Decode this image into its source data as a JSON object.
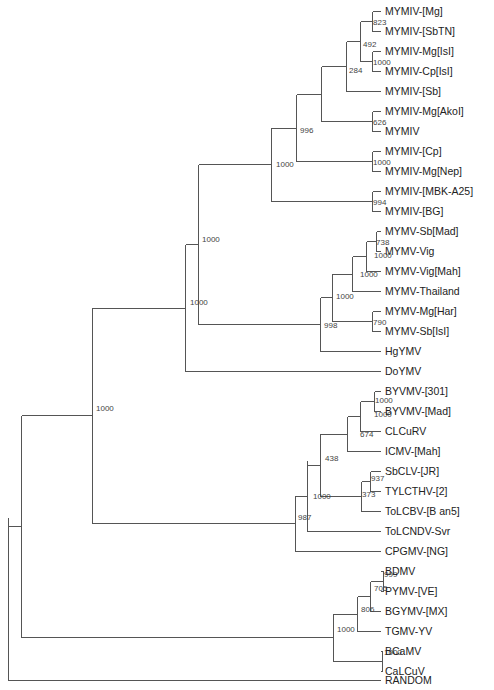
{
  "diagram": {
    "type": "phylogenetic-tree",
    "colors": {
      "branch": "#555555",
      "label": "#222222",
      "bootstrap": "#444444",
      "background": "#ffffff"
    },
    "leaf_x": 380,
    "leaves": [
      {
        "id": "L0",
        "label": "MYMIV-[Mg]",
        "y": 11
      },
      {
        "id": "L1",
        "label": "MYMIV-[SbTN]",
        "y": 31
      },
      {
        "id": "L2",
        "label": "MYMIV-Mg[IsI]",
        "y": 51
      },
      {
        "id": "L3",
        "label": "MYMIV-Cp[IsI]",
        "y": 71
      },
      {
        "id": "L4",
        "label": "MYMIV-[Sb]",
        "y": 91
      },
      {
        "id": "L5",
        "label": "MYMIV-Mg[AkoI]",
        "y": 111
      },
      {
        "id": "L6",
        "label": "MYMIV",
        "y": 131
      },
      {
        "id": "L7",
        "label": "MYMIV-[Cp]",
        "y": 151
      },
      {
        "id": "L8",
        "label": "MYMIV-Mg[Nep]",
        "y": 171
      },
      {
        "id": "L9",
        "label": "MYMIV-[MBK-A25]",
        "y": 191
      },
      {
        "id": "L10",
        "label": "MYMIV-[BG]",
        "y": 211
      },
      {
        "id": "L11",
        "label": "MYMV-Sb[Mad]",
        "y": 231
      },
      {
        "id": "L12",
        "label": "MYMV-Vig",
        "y": 251
      },
      {
        "id": "L13",
        "label": "MYMV-Vig[Mah]",
        "y": 271
      },
      {
        "id": "L14",
        "label": "MYMV-Thailand",
        "y": 291
      },
      {
        "id": "L15",
        "label": "MYMV-Mg[Har]",
        "y": 311
      },
      {
        "id": "L16",
        "label": "MYMV-Sb[IsI]",
        "y": 331
      },
      {
        "id": "L17",
        "label": "HgYMV",
        "y": 351
      },
      {
        "id": "L18",
        "label": "DoYMV",
        "y": 371
      },
      {
        "id": "L19",
        "label": "BYVMV-[301]",
        "y": 391
      },
      {
        "id": "L20",
        "label": "BYVMV-[Mad]",
        "y": 411
      },
      {
        "id": "L21",
        "label": "CLCuRV",
        "y": 431
      },
      {
        "id": "L22",
        "label": "ICMV-[Mah]",
        "y": 451
      },
      {
        "id": "L23",
        "label": "SbCLV-[JR]",
        "y": 471
      },
      {
        "id": "L24",
        "label": "TYLCTHV-[2]",
        "y": 491
      },
      {
        "id": "L25",
        "label": "ToLCBV-[B an5]",
        "y": 511
      },
      {
        "id": "L26",
        "label": "ToLCNDV-Svr",
        "y": 531
      },
      {
        "id": "L27",
        "label": "CPGMV-[NG]",
        "y": 551
      },
      {
        "id": "L28",
        "label": "BDMV",
        "y": 571
      },
      {
        "id": "L29",
        "label": "PYMV-[VE]",
        "y": 591
      },
      {
        "id": "L30",
        "label": "BGYMV-[MX]",
        "y": 611
      },
      {
        "id": "L31",
        "label": "TGMV-YV",
        "y": 631
      },
      {
        "id": "L32",
        "label": "BCaMV",
        "y": 651
      },
      {
        "id": "L33",
        "label": "CaLCuV",
        "y": 671
      },
      {
        "id": "L34",
        "label": "RANDOM",
        "y": 680
      }
    ],
    "nodes": [
      {
        "id": "n_mg_sbtn",
        "x": 372,
        "y1": 11,
        "y2": 31,
        "parent_x": 360,
        "bootstrap": "823",
        "bx": 373,
        "by": 25
      },
      {
        "id": "n_isi",
        "x": 372,
        "y1": 51,
        "y2": 71,
        "parent_x": 360,
        "bootstrap": "1000",
        "bx": 373,
        "by": 65
      },
      {
        "id": "n_492",
        "x": 360,
        "y1": 21,
        "y2": 61,
        "parent_x": 346,
        "bootstrap": "492",
        "bx": 363,
        "by": 47
      },
      {
        "id": "n_284",
        "x": 346,
        "y1": 41,
        "y2": 91,
        "parent_x": 321,
        "bootstrap": "284",
        "bx": 349,
        "by": 73
      },
      {
        "id": "n_akol",
        "x": 372,
        "y1": 111,
        "y2": 131,
        "parent_x": 321,
        "bootstrap": "626",
        "bx": 373,
        "by": 125
      },
      {
        "id": "n_998a",
        "x": 321,
        "y1": 66,
        "y2": 121,
        "parent_x": 296,
        "bootstrap": "",
        "bx": 0,
        "by": 0
      },
      {
        "id": "n_cp",
        "x": 372,
        "y1": 151,
        "y2": 171,
        "parent_x": 296,
        "bootstrap": "1000",
        "bx": 373,
        "by": 165
      },
      {
        "id": "n_996",
        "x": 296,
        "y1": 94,
        "y2": 161,
        "parent_x": 271,
        "bootstrap": "996",
        "bx": 300,
        "by": 133
      },
      {
        "id": "n_bg",
        "x": 372,
        "y1": 191,
        "y2": 211,
        "parent_x": 271,
        "bootstrap": "994",
        "bx": 373,
        "by": 205
      },
      {
        "id": "n_1000a",
        "x": 271,
        "y1": 127,
        "y2": 201,
        "parent_x": 198,
        "bootstrap": "1000",
        "bx": 276,
        "by": 167
      },
      {
        "id": "n_738",
        "x": 376,
        "y1": 231,
        "y2": 251,
        "parent_x": 366,
        "bootstrap": "738",
        "bx": 376,
        "by": 245
      },
      {
        "id": "n_vigmah",
        "x": 366,
        "y1": 241,
        "y2": 271,
        "parent_x": 352,
        "bootstrap": "1000",
        "bx": 374,
        "by": 258
      },
      {
        "id": "n_thai",
        "x": 352,
        "y1": 256,
        "y2": 291,
        "parent_x": 332,
        "bootstrap": "1000",
        "bx": 360,
        "by": 277
      },
      {
        "id": "n_har",
        "x": 372,
        "y1": 311,
        "y2": 331,
        "parent_x": 332,
        "bootstrap": "790",
        "bx": 373,
        "by": 325
      },
      {
        "id": "n_mymv",
        "x": 332,
        "y1": 273,
        "y2": 321,
        "parent_x": 320,
        "bootstrap": "1000",
        "bx": 336,
        "by": 299
      },
      {
        "id": "n_998",
        "x": 320,
        "y1": 297,
        "y2": 351,
        "parent_x": 198,
        "bootstrap": "998",
        "bx": 324,
        "by": 328
      },
      {
        "id": "n_1000b",
        "x": 198,
        "y1": 164,
        "y2": 324,
        "parent_x": 185,
        "bootstrap": "1000",
        "bx": 202,
        "by": 242
      },
      {
        "id": "n_1000c",
        "x": 185,
        "y1": 244,
        "y2": 371,
        "parent_x": 92,
        "bootstrap": "1000",
        "bx": 190,
        "by": 305
      },
      {
        "id": "n_byvmv",
        "x": 374,
        "y1": 391,
        "y2": 411,
        "parent_x": 360,
        "bootstrap": "1000",
        "bx": 375,
        "by": 403
      },
      {
        "id": "n_clcurv",
        "x": 360,
        "y1": 401,
        "y2": 431,
        "parent_x": 347,
        "bootstrap": "1000",
        "bx": 374,
        "by": 417
      },
      {
        "id": "n_674",
        "x": 347,
        "y1": 416,
        "y2": 451,
        "parent_x": 320,
        "bootstrap": "674",
        "bx": 360,
        "by": 437
      },
      {
        "id": "n_937",
        "x": 370,
        "y1": 471,
        "y2": 491,
        "parent_x": 361,
        "bootstrap": "937",
        "bx": 371,
        "by": 481
      },
      {
        "id": "n_373",
        "x": 361,
        "y1": 481,
        "y2": 511,
        "parent_x": 320,
        "bootstrap": "373",
        "bx": 362,
        "by": 497
      },
      {
        "id": "n_438",
        "x": 320,
        "y1": 433,
        "y2": 496,
        "parent_x": 307,
        "bootstrap": "438",
        "bx": 325,
        "by": 461
      },
      {
        "id": "n_1000d",
        "x": 307,
        "y1": 460,
        "y2": 531,
        "parent_x": 295,
        "bootstrap": "1000",
        "bx": 313,
        "by": 499
      },
      {
        "id": "n_987",
        "x": 295,
        "y1": 495,
        "y2": 551,
        "parent_x": 92,
        "bootstrap": "987",
        "bx": 298,
        "by": 520
      },
      {
        "id": "n_999",
        "x": 383,
        "y1": 571,
        "y2": 591,
        "parent_x": 370,
        "bootstrap": "999",
        "bx": 384,
        "by": 577
      },
      {
        "id": "n_705",
        "x": 370,
        "y1": 581,
        "y2": 611,
        "parent_x": 357,
        "bootstrap": "705",
        "bx": 374,
        "by": 591
      },
      {
        "id": "n_806",
        "x": 357,
        "y1": 596,
        "y2": 631,
        "parent_x": 333,
        "bootstrap": "806",
        "bx": 361,
        "by": 612
      },
      {
        "id": "n_bcamv",
        "x": 382,
        "y1": 651,
        "y2": 671,
        "parent_x": 333,
        "bootstrap": "1000",
        "bx": 384,
        "by": 655
      },
      {
        "id": "n_1000e",
        "x": 333,
        "y1": 613,
        "y2": 661,
        "parent_x": 21,
        "bootstrap": "1000",
        "bx": 337,
        "by": 632
      },
      {
        "id": "n_1000f",
        "x": 92,
        "y1": 307,
        "y2": 523,
        "parent_x": 21,
        "bootstrap": "1000",
        "bx": 96,
        "by": 411
      },
      {
        "id": "n_root_in",
        "x": 21,
        "y1": 415,
        "y2": 637,
        "parent_x": 8,
        "bootstrap": "",
        "bx": 0,
        "by": 0
      },
      {
        "id": "n_root",
        "x": 8,
        "y1": 517,
        "y2": 680,
        "parent_x": 8,
        "bootstrap": "",
        "bx": 0,
        "by": 0
      }
    ],
    "terminal_edges": [
      {
        "leaf": "L0",
        "from_x": 372
      },
      {
        "leaf": "L1",
        "from_x": 372
      },
      {
        "leaf": "L2",
        "from_x": 372
      },
      {
        "leaf": "L3",
        "from_x": 372
      },
      {
        "leaf": "L4",
        "from_x": 346
      },
      {
        "leaf": "L5",
        "from_x": 372
      },
      {
        "leaf": "L6",
        "from_x": 372
      },
      {
        "leaf": "L7",
        "from_x": 372
      },
      {
        "leaf": "L8",
        "from_x": 372
      },
      {
        "leaf": "L9",
        "from_x": 372
      },
      {
        "leaf": "L10",
        "from_x": 372
      },
      {
        "leaf": "L11",
        "from_x": 376
      },
      {
        "leaf": "L12",
        "from_x": 376
      },
      {
        "leaf": "L13",
        "from_x": 366
      },
      {
        "leaf": "L14",
        "from_x": 352
      },
      {
        "leaf": "L15",
        "from_x": 372
      },
      {
        "leaf": "L16",
        "from_x": 372
      },
      {
        "leaf": "L17",
        "from_x": 320
      },
      {
        "leaf": "L18",
        "from_x": 185
      },
      {
        "leaf": "L19",
        "from_x": 374
      },
      {
        "leaf": "L20",
        "from_x": 374
      },
      {
        "leaf": "L21",
        "from_x": 360
      },
      {
        "leaf": "L22",
        "from_x": 347
      },
      {
        "leaf": "L23",
        "from_x": 370
      },
      {
        "leaf": "L24",
        "from_x": 370
      },
      {
        "leaf": "L25",
        "from_x": 361
      },
      {
        "leaf": "L26",
        "from_x": 307
      },
      {
        "leaf": "L27",
        "from_x": 295
      },
      {
        "leaf": "L28",
        "from_x": 383
      },
      {
        "leaf": "L29",
        "from_x": 383
      },
      {
        "leaf": "L30",
        "from_x": 370
      },
      {
        "leaf": "L31",
        "from_x": 357
      },
      {
        "leaf": "L32",
        "from_x": 382
      },
      {
        "leaf": "L33",
        "from_x": 382
      },
      {
        "leaf": "L34",
        "from_x": 8
      }
    ]
  }
}
